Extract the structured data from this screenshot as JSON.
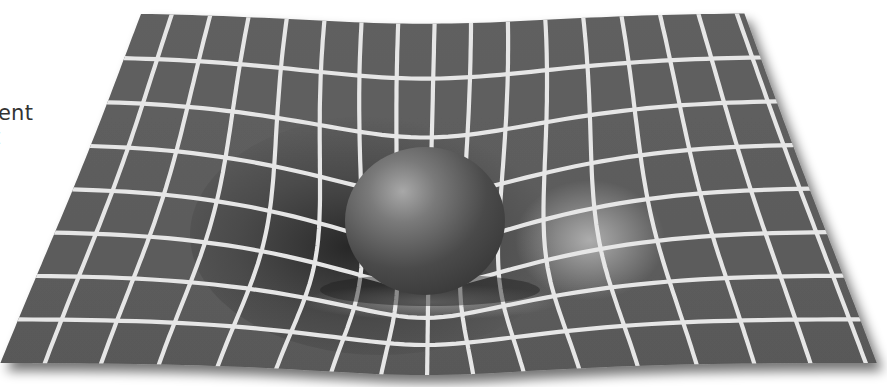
{
  "figure": {
    "background_color": "#ffffff",
    "surface_color": "#5c5c5c",
    "grid_line_color": "#e6e6e6",
    "sphere_color": "#4a4a4a",
    "sphere_highlight_color": "#9a9a9a"
  },
  "caption_fragment": {
    "line1": "ent",
    "line2": "t"
  },
  "grid": {
    "top_left": [
      140,
      13
    ],
    "top_right": [
      745,
      13
    ],
    "bottom_left": [
      0,
      363
    ],
    "bottom_right": [
      877,
      363
    ],
    "columns": 16,
    "rows": 8,
    "line_width": 4.2
  },
  "sphere": {
    "cx": 425,
    "cy": 221,
    "rx": 80,
    "ry": 74
  },
  "well": {
    "cx": 425,
    "cy": 235,
    "radius": 175,
    "depth": 55,
    "pinch": 0.38
  }
}
